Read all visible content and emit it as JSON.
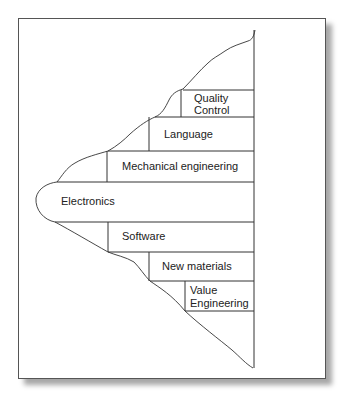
{
  "diagram": {
    "type": "skill-layer-profile",
    "bands": [
      {
        "id": "quality-control",
        "label_lines": [
          "Quality",
          "Control"
        ]
      },
      {
        "id": "language",
        "label_lines": [
          "Language"
        ]
      },
      {
        "id": "mechanical-engineering",
        "label_lines": [
          "Mechanical engineering"
        ]
      },
      {
        "id": "electronics",
        "label_lines": [
          "Electronics"
        ]
      },
      {
        "id": "software",
        "label_lines": [
          "Software"
        ]
      },
      {
        "id": "new-materials",
        "label_lines": [
          "New materials"
        ]
      },
      {
        "id": "value-engineering",
        "label_lines": [
          "Value",
          "Engineering"
        ]
      }
    ]
  }
}
